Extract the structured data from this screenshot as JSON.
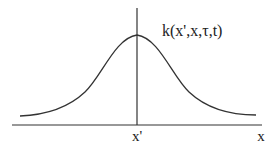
{
  "diagram": {
    "type": "bell-curve-kernel",
    "curve_label": "k(x',x,τ,t)",
    "peak_label": "x'",
    "axis_label": "x",
    "colors": {
      "stroke": "#333333",
      "text": "#222222",
      "background": "#ffffff"
    },
    "geometry": {
      "axis_y": 125,
      "axis_x_start": 12,
      "axis_x_end": 262,
      "peak_x": 137,
      "peak_y": 35,
      "vertical_top": 8,
      "tail_left": [
        20,
        116
      ],
      "tail_right": [
        256,
        115
      ]
    }
  }
}
